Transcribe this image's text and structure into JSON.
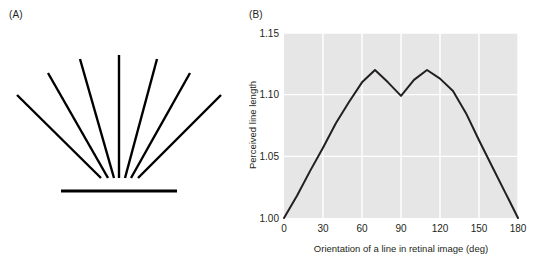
{
  "figure": {
    "panels": [
      {
        "label": "(A)",
        "name": "panel-a"
      },
      {
        "label": "(B)",
        "name": "panel-b"
      }
    ]
  },
  "panel_a": {
    "label": "(A)",
    "description": "Fan of radiating straight lines above a horizontal baseline",
    "line_color": "#000000",
    "line_count": 7,
    "baseline": {
      "x1": 61,
      "y1": 191,
      "x2": 177,
      "y2": 191
    },
    "rays": [
      {
        "x1": 17,
        "y1": 95,
        "x2": 101,
        "y2": 178,
        "angle_deg": 0
      },
      {
        "x1": 48,
        "y1": 73,
        "x2": 108,
        "y2": 178,
        "angle_deg": 30
      },
      {
        "x1": 80,
        "y1": 59,
        "x2": 114,
        "y2": 178,
        "angle_deg": 60
      },
      {
        "x1": 119,
        "y1": 55,
        "x2": 119,
        "y2": 178,
        "angle_deg": 90
      },
      {
        "x1": 157,
        "y1": 59,
        "x2": 125,
        "y2": 178,
        "angle_deg": 120
      },
      {
        "x1": 190,
        "y1": 73,
        "x2": 131,
        "y2": 178,
        "angle_deg": 150
      },
      {
        "x1": 221,
        "y1": 95,
        "x2": 138,
        "y2": 178,
        "angle_deg": 180
      }
    ]
  },
  "panel_b": {
    "label": "(B)",
    "plot_background": "#e6e6e6",
    "grid_color": "#ffffff",
    "curve_color": "#231f20"
  },
  "chart_data": {
    "type": "line",
    "title": "",
    "xlabel": "Orientation of a line in retinal image (deg)",
    "ylabel": "Perceived line length",
    "xlim": [
      0,
      180
    ],
    "ylim": [
      1.0,
      1.15
    ],
    "xticks": [
      0,
      30,
      60,
      90,
      120,
      150,
      180
    ],
    "xticklabels": [
      "0",
      "30",
      "60",
      "90",
      "120",
      "150",
      "180"
    ],
    "yticks": [
      1.0,
      1.05,
      1.1,
      1.15
    ],
    "yticklabels": [
      "1.00",
      "1.05",
      "1.10",
      "1.15"
    ],
    "grid": true,
    "legend": null,
    "series": [
      {
        "name": "Perceived line length",
        "x": [
          0,
          10,
          20,
          30,
          40,
          50,
          60,
          70,
          80,
          90,
          100,
          110,
          120,
          130,
          140,
          150,
          160,
          170,
          180
        ],
        "y": [
          1.0,
          1.018,
          1.038,
          1.057,
          1.077,
          1.094,
          1.11,
          1.12,
          1.11,
          1.099,
          1.112,
          1.12,
          1.113,
          1.103,
          1.085,
          1.063,
          1.042,
          1.021,
          1.0
        ]
      }
    ]
  }
}
